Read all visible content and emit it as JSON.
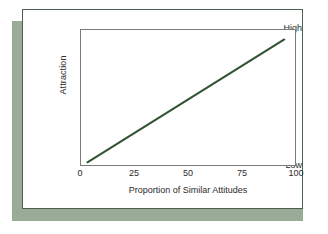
{
  "figure": {
    "card_border_color": "#4a6150",
    "shadow_color": "#9aab97",
    "background_color": "#ffffff",
    "plot_frame_color": "#7a7a7a"
  },
  "chart_data": {
    "type": "line",
    "title": "",
    "xlabel": "Proportion of Similar Attitudes",
    "ylabel": "Attraction",
    "xlim": [
      0,
      100
    ],
    "ylim": [
      0,
      100
    ],
    "grid": false,
    "legend": "none",
    "xticks": [
      0,
      25,
      50,
      75,
      100
    ],
    "xtick_labels": [
      "0",
      "25",
      "50",
      "75",
      "100"
    ],
    "yticks": [
      0,
      100
    ],
    "ytick_labels": [
      "Low",
      "High"
    ],
    "series": [
      {
        "name": "Attraction vs. Similarity",
        "color": "#2f5233",
        "linewidth": 2,
        "x": [
          3,
          95
        ],
        "y": [
          2,
          93
        ]
      }
    ],
    "annotations": []
  }
}
